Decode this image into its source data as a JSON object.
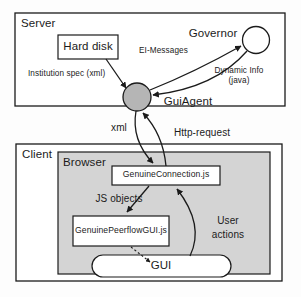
{
  "diagram": {
    "type": "architecture-block-diagram",
    "containers": [
      {
        "id": "server",
        "label": "Server"
      },
      {
        "id": "client",
        "label": "Client"
      },
      {
        "id": "browser",
        "label": "Browser"
      }
    ],
    "nodes": [
      {
        "id": "hard-disk",
        "label": "Hard disk",
        "shape": "rectangle"
      },
      {
        "id": "governor",
        "label": "Governor",
        "shape": "circle"
      },
      {
        "id": "gui-agent",
        "label": "GuiAgent",
        "shape": "filled-circle"
      },
      {
        "id": "genuine-connection",
        "label": "GenuineConnection.js",
        "shape": "rectangle"
      },
      {
        "id": "genuine-peerflow-gui",
        "label": "GenuinePeerflowGUI.js",
        "shape": "rectangle"
      },
      {
        "id": "gui",
        "label": "GUI",
        "shape": "ellipse"
      }
    ],
    "edges": [
      {
        "id": "hard-disk-to-gui-agent",
        "label": "Institution spec (xml)",
        "from": "hard-disk",
        "to": "gui-agent"
      },
      {
        "id": "gui-agent-to-governor",
        "label": "EI-Messages",
        "from": "gui-agent",
        "to": "governor"
      },
      {
        "id": "governor-to-gui-agent",
        "label_line1": "Dynamic Info",
        "label_line2": "(java)",
        "from": "governor",
        "to": "gui-agent"
      },
      {
        "id": "gui-agent-to-connection",
        "label": "xml",
        "from": "gui-agent",
        "to": "genuine-connection"
      },
      {
        "id": "connection-to-gui-agent",
        "label": "Http-request",
        "from": "genuine-connection",
        "to": "gui-agent"
      },
      {
        "id": "connection-to-peerflow",
        "label": "JS objects",
        "from": "genuine-connection",
        "to": "genuine-peerflow-gui"
      },
      {
        "id": "gui-to-connection",
        "label_line1": "User",
        "label_line2": "actions",
        "from": "gui",
        "to": "genuine-connection"
      },
      {
        "id": "peerflow-to-gui",
        "label": "",
        "from": "genuine-peerflow-gui",
        "to": "gui"
      }
    ],
    "colors": {
      "stroke": "#1b1b1b",
      "browser_fill": "#d4d4d4",
      "gui_agent_fill": "#b5b5b5",
      "box_fill": "#ffffff",
      "page_bg": "#fdfdfd"
    }
  }
}
